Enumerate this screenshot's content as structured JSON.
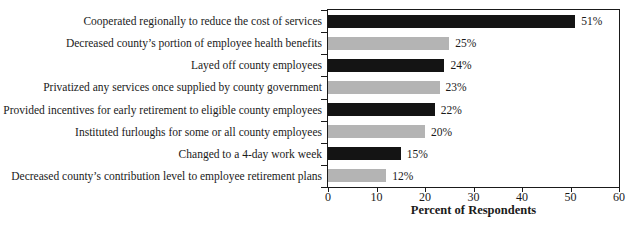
{
  "chart_data": {
    "type": "bar",
    "orientation": "horizontal",
    "title": "",
    "xlabel": "Percent of Respondents",
    "ylabel": "",
    "xlim": [
      0,
      60
    ],
    "xticks": [
      0,
      10,
      20,
      30,
      40,
      50,
      60
    ],
    "grid": false,
    "legend": false,
    "categories": [
      "Cooperated regionally to reduce the cost of services",
      "Decreased county’s portion of employee health benefits",
      "Layed off county employees",
      "Privatized any services once supplied by county government",
      "Provided incentives for early retirement to eligible county employees",
      "Instituted furloughs for some or all county employees",
      "Changed to a 4-day work week",
      "Decreased county’s contribution level to employee retirement plans"
    ],
    "values": [
      51,
      25,
      24,
      23,
      22,
      20,
      15,
      12
    ],
    "value_labels": [
      "51%",
      "25%",
      "24%",
      "23%",
      "22%",
      "20%",
      "15%",
      "12%"
    ],
    "bar_colors": [
      "#141414",
      "#b4b4b4",
      "#141414",
      "#b4b4b4",
      "#141414",
      "#b4b4b4",
      "#141414",
      "#b4b4b4"
    ],
    "colors": {
      "bar_dark": "#141414",
      "bar_light": "#b4b4b4",
      "axis": "#1a1a1a",
      "text": "#1a1a1a",
      "background": "#ffffff"
    }
  }
}
